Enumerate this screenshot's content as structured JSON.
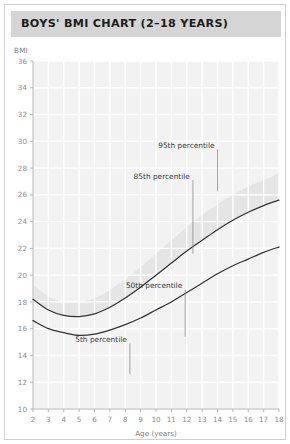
{
  "header": {
    "title": "BOYS' BMI CHART (2–18 YEARS)"
  },
  "chart_data": {
    "type": "line",
    "title": "BOYS' BMI CHART (2–18 YEARS)",
    "xlabel": "Age (years)",
    "ylabel": "BMI",
    "xlim": [
      2,
      18
    ],
    "ylim": [
      10,
      36
    ],
    "grid": true,
    "legend_position": "inline-annotations",
    "x_ticks": [
      2,
      3,
      4,
      5,
      6,
      7,
      8,
      9,
      10,
      11,
      12,
      13,
      14,
      15,
      16,
      17,
      18
    ],
    "y_ticks": [
      10,
      12,
      14,
      16,
      18,
      20,
      22,
      24,
      26,
      28,
      30,
      32,
      34,
      36
    ],
    "x": [
      2,
      3,
      4,
      5,
      6,
      7,
      8,
      9,
      10,
      11,
      12,
      13,
      14,
      15,
      16,
      17,
      18
    ],
    "series": [
      {
        "name": "95th percentile",
        "drawn": false,
        "values": [
          19.3,
          18.4,
          18.0,
          18.0,
          18.3,
          18.9,
          19.7,
          20.6,
          21.6,
          22.6,
          23.6,
          24.5,
          25.3,
          26.0,
          26.6,
          27.1,
          27.6
        ]
      },
      {
        "name": "85th percentile",
        "drawn": true,
        "values": [
          18.2,
          17.4,
          17.0,
          16.9,
          17.1,
          17.6,
          18.3,
          19.1,
          20.0,
          20.9,
          21.8,
          22.6,
          23.4,
          24.1,
          24.7,
          25.2,
          25.6
        ]
      },
      {
        "name": "50th percentile",
        "drawn": true,
        "values": [
          16.6,
          16.0,
          15.7,
          15.5,
          15.6,
          15.9,
          16.3,
          16.8,
          17.4,
          18.0,
          18.7,
          19.4,
          20.1,
          20.7,
          21.2,
          21.7,
          22.1
        ]
      },
      {
        "name": "5th percentile",
        "drawn": false,
        "values": [
          14.7,
          14.3,
          14.0,
          13.9,
          13.9,
          14.0,
          14.3,
          14.6,
          15.0,
          15.5,
          16.0,
          16.5,
          17.0,
          17.4,
          17.8,
          18.1,
          18.4
        ]
      }
    ],
    "annotations": [
      {
        "label": "95th percentile",
        "leader_x": 14.0,
        "leader_y_top": 29.4,
        "leader_y_bottom": 26.3
      },
      {
        "label": "85th percentile",
        "leader_x": 12.4,
        "leader_y_top": 27.1,
        "leader_y_bottom": 21.6
      },
      {
        "label": "50th percentile",
        "leader_x": 11.9,
        "leader_y_top": 18.9,
        "leader_y_bottom": 15.4
      },
      {
        "label": "5th percentile",
        "leader_x": 8.3,
        "leader_y_top": 14.9,
        "leader_y_bottom": 12.6
      }
    ],
    "shaded_band": {
      "between": [
        "85th percentile",
        "95th percentile"
      ],
      "color": "#e0e0e0"
    },
    "colors": {
      "curve": "#333333",
      "plot_background": "#f2f2f2",
      "gridline": "#ffffff",
      "axis": "#b5b5b5",
      "header_background": "#d5d5d5",
      "header_text": "#1c1c1c",
      "tick_text": "#8a8a8a",
      "annotation_text": "#3a3a3a"
    }
  }
}
